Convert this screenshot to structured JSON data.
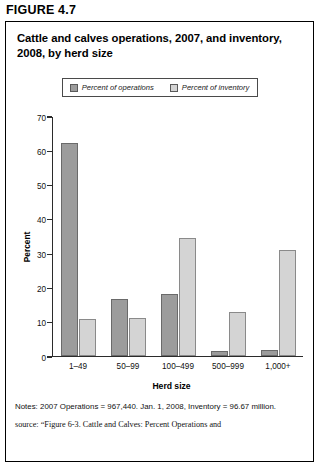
{
  "figure_label": "FIGURE 4.7",
  "chart_title": "Cattle and calves operations, 2007, and inventory, 2008, by herd size",
  "legend": {
    "items": [
      {
        "label": "Percent of operations",
        "color": "#9c9c9c",
        "swatch_name": "legend-swatch-operations"
      },
      {
        "label": "Percent of inventory",
        "color": "#d4d4d4",
        "swatch_name": "legend-swatch-inventory"
      }
    ]
  },
  "notes": "Notes: 2007 Operations = 967,440. Jan. 1, 2008, Inventory = 96.67 million.",
  "source": "source: “Figure 6-3. Cattle and Calves: Percent Operations and",
  "chart_data": {
    "type": "bar",
    "title": "Cattle and calves operations, 2007, and inventory, 2008, by herd size",
    "xlabel": "Herd size",
    "ylabel": "Percent",
    "ylim": [
      0,
      70
    ],
    "yticks": [
      0,
      10,
      20,
      30,
      40,
      50,
      60,
      70
    ],
    "grid": false,
    "legend_position": "top-center",
    "categories": [
      "1–49",
      "50–99",
      "100–499",
      "500–999",
      "1,000+"
    ],
    "series": [
      {
        "name": "Percent of operations",
        "color": "#9c9c9c",
        "values": [
          62.5,
          16.5,
          18.0,
          1.3,
          1.8
        ]
      },
      {
        "name": "Percent of inventory",
        "color": "#d4d4d4",
        "values": [
          10.7,
          11.2,
          34.5,
          12.8,
          31.0
        ]
      }
    ]
  }
}
